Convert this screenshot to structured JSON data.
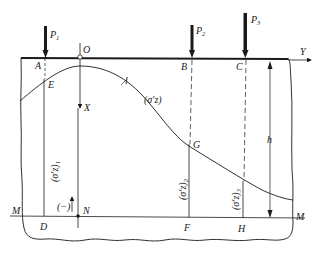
{
  "diagram": {
    "loads": [
      {
        "id": "P1",
        "label": "P",
        "sub": "1",
        "point": "A"
      },
      {
        "id": "P2",
        "label": "P",
        "sub": "2",
        "point": "B"
      },
      {
        "id": "P3",
        "label": "P",
        "sub": "3",
        "point": "C"
      }
    ],
    "axes": {
      "origin": "O",
      "x_axis": "X",
      "y_axis": "Y"
    },
    "surface_points": [
      "A",
      "B",
      "C"
    ],
    "curve_points": [
      "E",
      "G"
    ],
    "curve_label": "l",
    "curve_stress_label": "(σ′z)",
    "plane_label": "M",
    "plane_points": [
      "D",
      "N",
      "F",
      "H"
    ],
    "stress_ordinates": [
      {
        "label": "(σ′z)",
        "sub": "1",
        "from": "E",
        "to": "D"
      },
      {
        "label": "(σ′z)",
        "sub": "2",
        "from": "G",
        "to": "F"
      },
      {
        "label": "(σ′z)",
        "sub": "3",
        "from": "curve",
        "to": "H"
      }
    ],
    "sign_label": "(−)",
    "depth_label": "h",
    "colors": {
      "ink": "#1a1a1a",
      "background": "#ffffff"
    }
  }
}
